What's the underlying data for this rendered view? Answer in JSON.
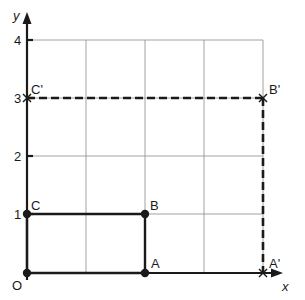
{
  "diagram": {
    "type": "coordinate-grid-enlargement",
    "axes": {
      "x_label": "x",
      "y_label": "y",
      "origin_label": "O",
      "x_range": [
        0,
        4
      ],
      "y_range": [
        0,
        4
      ],
      "y_ticks": [
        "1",
        "2",
        "3",
        "4"
      ]
    },
    "grid": {
      "spacing": 1,
      "color": "#8a8a8a"
    },
    "original_shape": {
      "style": "solid",
      "color": "#1a1a1a",
      "points": [
        {
          "label": "O",
          "x": 0,
          "y": 0
        },
        {
          "label": "A",
          "x": 2,
          "y": 0
        },
        {
          "label": "B",
          "x": 2,
          "y": 1
        },
        {
          "label": "C",
          "x": 0,
          "y": 1
        }
      ]
    },
    "image_shape": {
      "style": "dashed",
      "color": "#1a1a1a",
      "points": [
        {
          "label": "A'",
          "x": 4,
          "y": 0
        },
        {
          "label": "B'",
          "x": 4,
          "y": 3
        },
        {
          "label": "C'",
          "x": 0,
          "y": 3
        }
      ]
    }
  },
  "labels": {
    "x": "x",
    "y": "y",
    "O": "O",
    "A": "A",
    "B": "B",
    "C": "C",
    "A_prime": "A'",
    "B_prime": "B'",
    "C_prime": "C'",
    "t1": "1",
    "t2": "2",
    "t3": "3",
    "t4": "4"
  }
}
